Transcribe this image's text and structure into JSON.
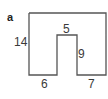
{
  "panel_label": "a",
  "shape": {
    "description": "Rectilinear U-shaped figure (rectangle with rectangular notch cut from bottom)",
    "stroke_color": "#555555"
  },
  "dimensions": {
    "left_height": "14",
    "notch_width": "5",
    "notch_height": "9",
    "bottom_left": "6",
    "bottom_right": "7"
  }
}
